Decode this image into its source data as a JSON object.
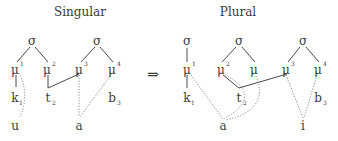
{
  "arrow": "⇒",
  "singular": {
    "title": "Singular",
    "sigmas": [
      "σ",
      "σ"
    ],
    "morae": [
      {
        "base": "μ",
        "sup": "1"
      },
      {
        "base": "μ",
        "sup": "2"
      },
      {
        "base": "μ",
        "sup": "3"
      },
      {
        "base": "μ",
        "sup": "4"
      }
    ],
    "consonants": [
      {
        "base": "k",
        "sub": "1"
      },
      {
        "base": "t",
        "sub": "2"
      },
      {
        "base": "b",
        "sub": "3"
      }
    ],
    "vowels": [
      "u",
      "a"
    ]
  },
  "plural": {
    "title": "Plural",
    "sigmas": [
      "σ",
      "σ",
      "σ"
    ],
    "morae": [
      {
        "base": "μ",
        "sup": "1"
      },
      {
        "base": "μ",
        "sup": "2"
      },
      {
        "base": "μ",
        "sup": ""
      },
      {
        "base": "μ",
        "sup": "3"
      },
      {
        "base": "μ",
        "sup": "4"
      }
    ],
    "consonants": [
      {
        "base": "k",
        "sub": "1"
      },
      {
        "base": "t",
        "sub": "2"
      },
      {
        "base": "b",
        "sub": "3"
      }
    ],
    "vowels": [
      "a",
      "i"
    ]
  }
}
